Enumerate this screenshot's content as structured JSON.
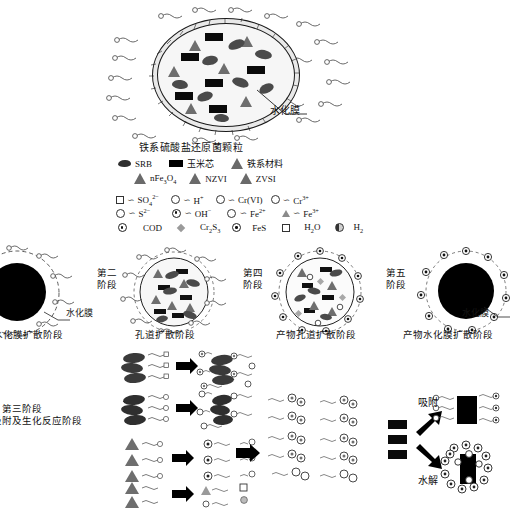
{
  "figure": {
    "kind": "scientific-schematic",
    "topic": "Iron-based sulfate-reducing bacteria granule: five-stage diffusion & reaction mechanism"
  },
  "top_panel": {
    "title": "铁系硫酸盐还原菌颗粒",
    "hydration_film_label": "水化膜"
  },
  "legend": {
    "materials_row1": [
      {
        "icon": "srb-blob-icon",
        "label": "SRB"
      },
      {
        "icon": "corn-cob-rect-icon",
        "label": "玉米芯"
      },
      {
        "icon": "iron-material-triangle-icon",
        "label": "铁系材料"
      }
    ],
    "materials_row2": [
      {
        "icon": "triangle-icon",
        "label": "nFe3O4",
        "html": "nFe<sub>3</sub>O<sub>4</sub>"
      },
      {
        "icon": "triangle-icon",
        "label": "NZVI",
        "html": "NZVI"
      },
      {
        "icon": "triangle-icon",
        "label": "ZVSI",
        "html": "ZVSI"
      }
    ],
    "ions_row1": [
      {
        "icon": "square-open-icon",
        "label": "SO42-",
        "html": "SO<sub>4</sub><sup>2&minus;</sup>"
      },
      {
        "icon": "circle-open-icon",
        "label": "H+",
        "html": "H<sup>+</sup>"
      },
      {
        "icon": "circle-open-icon",
        "label": "Cr(VI)",
        "html": "Cr(VI)"
      },
      {
        "icon": "circle-open-icon",
        "label": "Cr3+",
        "html": "Cr<sup>3+</sup>"
      }
    ],
    "ions_row2": [
      {
        "icon": "circle-open-icon",
        "label": "S2-",
        "html": "S<sup>2&minus;</sup>"
      },
      {
        "icon": "circle-half-icon",
        "label": "OH-",
        "html": "OH<sup>&minus;</sup>"
      },
      {
        "icon": "circle-dot-icon",
        "label": "Fe2+",
        "html": "Fe<sup>2+</sup>"
      },
      {
        "icon": "triangle-small-icon",
        "label": "Fe3+",
        "html": "Fe<sup>3+</sup>"
      }
    ],
    "ions_row3": [
      {
        "icon": "circle-dot-icon",
        "label": "COD",
        "html": "COD"
      },
      {
        "icon": "diamond-icon",
        "label": "Cr2S3",
        "html": "Cr<sub>2</sub>S<sub>3</sub>"
      },
      {
        "icon": "circle-dot-icon",
        "label": "FeS",
        "html": "FeS"
      },
      {
        "icon": "square-open-icon",
        "label": "H2O",
        "html": "H<sub>2</sub>O"
      },
      {
        "icon": "circle-half-icon",
        "label": "H2",
        "html": "H<sub>2</sub>"
      }
    ]
  },
  "stages": [
    {
      "id": "stage-1",
      "number": "第一\n阶段",
      "number_line1": "第一",
      "number_line2": "阶段",
      "caption": "水化膜扩散阶段",
      "annotation": "水化膜"
    },
    {
      "id": "stage-2",
      "number_line1": "第二",
      "number_line2": "阶段",
      "caption": "孔道扩散阶段",
      "annotation": ""
    },
    {
      "id": "stage-4",
      "number_line1": "第四",
      "number_line2": "阶段",
      "caption": "产物孔道扩散阶段",
      "annotation": ""
    },
    {
      "id": "stage-5",
      "number_line1": "第五",
      "number_line2": "阶段",
      "caption": "产物水化膜扩散阶段",
      "annotation": "水化膜"
    }
  ],
  "stage3": {
    "number_line1": "第三阶段",
    "caption": "吸附及生化反应阶段"
  },
  "reaction_panel": {
    "adsorption_label": "吸附",
    "hydrolysis_label": "水解"
  },
  "colors": {
    "ink": "#111111",
    "corn_black": "#0a0a0a",
    "srb_gray": "#4a4a4a",
    "iron_gray": "#6e6e6e",
    "film": "#f2f2f2",
    "background": "#ffffff"
  }
}
